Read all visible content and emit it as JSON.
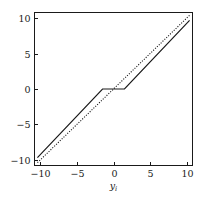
{
  "chart_data": {
    "type": "line",
    "title": "",
    "xlabel": "y",
    "xlabel_sub": "i",
    "ylabel": "",
    "xlim": [
      -10.8,
      10.8
    ],
    "ylim": [
      -10.8,
      10.8
    ],
    "xticks": [
      -10,
      -5,
      0,
      5,
      10
    ],
    "yticks": [
      -10,
      -5,
      0,
      5,
      10
    ],
    "xtick_labels": [
      "−10",
      "−5",
      "0",
      "5",
      "10"
    ],
    "ytick_labels": [
      "−10",
      "−5",
      "0",
      "5",
      "10"
    ],
    "grid": false,
    "legend": false,
    "frame": true,
    "tick_direction": "in",
    "series": [
      {
        "name": "identity",
        "style": "dotted",
        "color": "#1a1a1a",
        "x": [
          -10.4,
          10.4
        ],
        "values": [
          -10.4,
          10.4
        ]
      },
      {
        "name": "thresholded",
        "style": "solid",
        "color": "#1a1a1a",
        "x": [
          -10.4,
          -1.5,
          1.5,
          10.4
        ],
        "values": [
          -9.7,
          0,
          0,
          9.7
        ]
      }
    ],
    "annotations": []
  },
  "axes": {
    "x_tick_values": [
      -10,
      -5,
      0,
      5,
      10
    ],
    "y_tick_values": [
      -10,
      -5,
      0,
      5,
      10
    ]
  },
  "colors": {
    "ink": "#1a1a1a",
    "background": "#ffffff"
  }
}
